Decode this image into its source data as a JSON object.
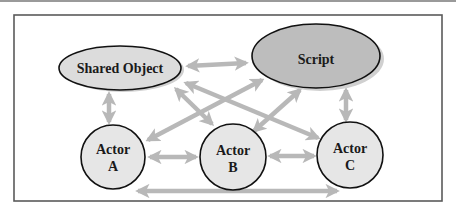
{
  "diagram": {
    "colors": {
      "frame": "#5a5a5a",
      "arrow": "#b8b8b8",
      "shadow": "#d0d0d0",
      "node_stroke": "#111111",
      "shared_object_fill": "#dcdcdc",
      "script_fill": "#bdbdbd",
      "actor_fill": "#e6e6e6"
    },
    "nodes": {
      "shared_object": {
        "label": "Shared Object"
      },
      "script": {
        "label": "Script"
      },
      "actor_a": {
        "line1": "Actor",
        "line2": "A"
      },
      "actor_b": {
        "line1": "Actor",
        "line2": "B"
      },
      "actor_c": {
        "line1": "Actor",
        "line2": "C"
      }
    },
    "edges": [
      {
        "from": "Shared Object",
        "to": "Script",
        "direction": "bidirectional"
      },
      {
        "from": "Shared Object",
        "to": "Actor A",
        "direction": "bidirectional"
      },
      {
        "from": "Shared Object",
        "to": "Actor B",
        "direction": "bidirectional"
      },
      {
        "from": "Shared Object",
        "to": "Actor C",
        "direction": "bidirectional"
      },
      {
        "from": "Script",
        "to": "Actor A",
        "direction": "bidirectional"
      },
      {
        "from": "Script",
        "to": "Actor B",
        "direction": "bidirectional"
      },
      {
        "from": "Script",
        "to": "Actor C",
        "direction": "bidirectional"
      },
      {
        "from": "Actor A",
        "to": "Actor B",
        "direction": "bidirectional"
      },
      {
        "from": "Actor B",
        "to": "Actor C",
        "direction": "bidirectional"
      },
      {
        "from": "Actor A",
        "to": "Actor C",
        "direction": "bidirectional"
      }
    ]
  }
}
